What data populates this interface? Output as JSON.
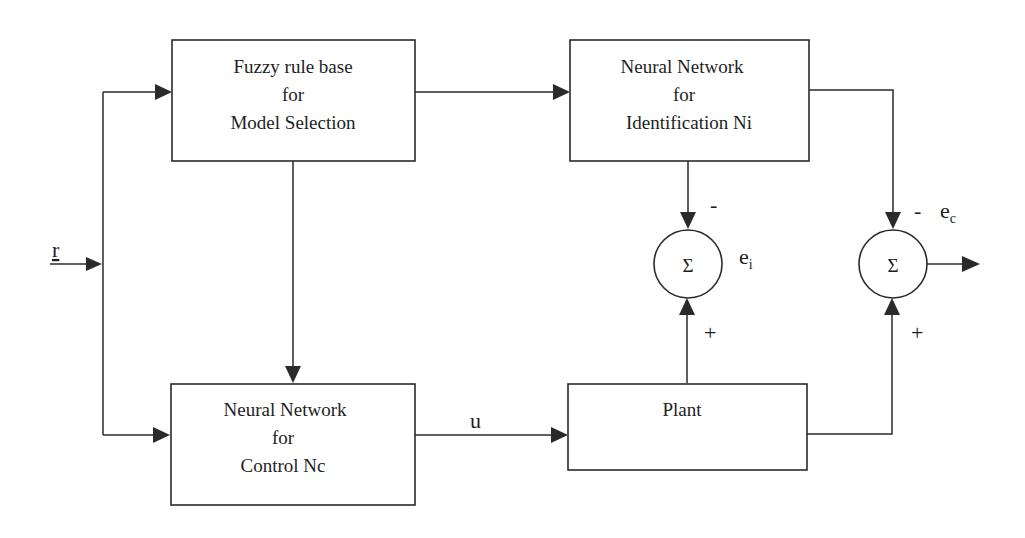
{
  "diagram": {
    "type": "block-diagram",
    "title": "",
    "colors": {
      "line": "#2a2a2a",
      "text": "#1e1e1e",
      "background": "#ffffff"
    },
    "blocks": [
      {
        "id": "fuzzy",
        "lines": [
          "Fuzzy rule base",
          "for",
          "Model Selection"
        ]
      },
      {
        "id": "ni",
        "lines": [
          "Neural Network",
          "for",
          "Identification  Ni"
        ]
      },
      {
        "id": "nc",
        "lines": [
          "Neural Network",
          "for",
          "Control  Nc"
        ]
      },
      {
        "id": "plant",
        "lines": [
          "Plant"
        ]
      }
    ],
    "junctions": [
      {
        "id": "sum_i",
        "symbol": "Σ",
        "top_sign": "-",
        "bottom_sign": "+",
        "output_label": "e",
        "output_sub": "i"
      },
      {
        "id": "sum_c",
        "symbol": "Σ",
        "top_sign": "-",
        "bottom_sign": "+",
        "output_label": "e",
        "output_sub": "c"
      }
    ],
    "signals": {
      "reference": "r",
      "control": "u"
    },
    "connections": [
      {
        "from": "r",
        "to": "fuzzy"
      },
      {
        "from": "r",
        "to": "nc"
      },
      {
        "from": "fuzzy",
        "to": "ni"
      },
      {
        "from": "fuzzy",
        "to": "nc"
      },
      {
        "from": "nc",
        "to": "plant",
        "label": "u"
      },
      {
        "from": "ni",
        "to": "sum_i",
        "sign": "-"
      },
      {
        "from": "plant",
        "to": "sum_i",
        "sign": "+"
      },
      {
        "from": "ni",
        "to": "sum_c",
        "sign": "-"
      },
      {
        "from": "plant",
        "to": "sum_c",
        "sign": "+"
      },
      {
        "from": "sum_c",
        "to": "output"
      }
    ]
  }
}
